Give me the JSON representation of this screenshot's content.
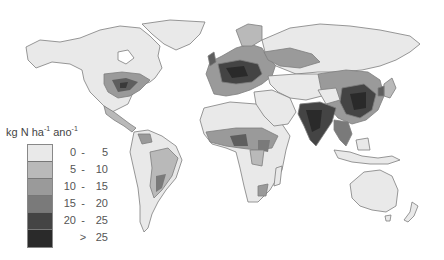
{
  "map": {
    "title": "",
    "variable": "Nitrogen deposition",
    "legend": {
      "unit_label": "kg N ha",
      "unit_sup1": "-1",
      "unit_mid": " ano",
      "unit_sup2": "-1",
      "classes": [
        {
          "lo": "0",
          "dash": "-",
          "hi": "5",
          "color": "#e9e9e9"
        },
        {
          "lo": "5",
          "dash": "-",
          "hi": "10",
          "color": "#b9b9b9"
        },
        {
          "lo": "10",
          "dash": "-",
          "hi": "15",
          "color": "#9a9a9a"
        },
        {
          "lo": "15",
          "dash": "-",
          "hi": "20",
          "color": "#7a7a7a"
        },
        {
          "lo": "20",
          "dash": "-",
          "hi": "25",
          "color": "#444444"
        },
        {
          "lo": "",
          "dash": ">",
          "hi": "25",
          "color": "#2a2a2a"
        }
      ]
    },
    "colors": {
      "land_low": "#e9e9e9",
      "border": "#7d7d7d",
      "ocean": "#ffffff"
    },
    "regions_shown": [
      "North America",
      "Greenland",
      "South America",
      "Europe",
      "Africa",
      "Asia",
      "Australia",
      "New Zealand"
    ]
  }
}
